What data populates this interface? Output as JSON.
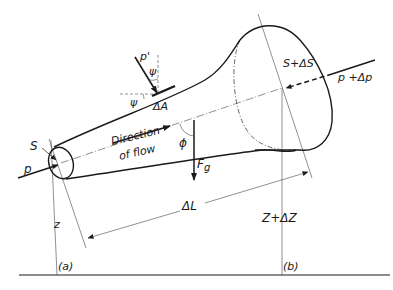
{
  "diagram": {
    "labels": {
      "S": "S",
      "S_plus_dS": "S+ΔS",
      "p": "p",
      "p_plus_dp": "p +Δp",
      "p_prime": "p'",
      "psi_top": "ψ",
      "psi_left": "ψ",
      "delta_A": "ΔA",
      "direction_line1": "Direction",
      "direction_line2": "of flow",
      "phi": "ϕ",
      "Fg_main": "F",
      "Fg_sub": "g",
      "z": "z",
      "Z_plus_dZ": "Z+ΔZ",
      "delta_L": "ΔL",
      "section_a": "(a)",
      "section_b": "(b)"
    },
    "colors": {
      "ink": "#1a1a1a",
      "thin": "#444444",
      "background": "#ffffff"
    }
  }
}
